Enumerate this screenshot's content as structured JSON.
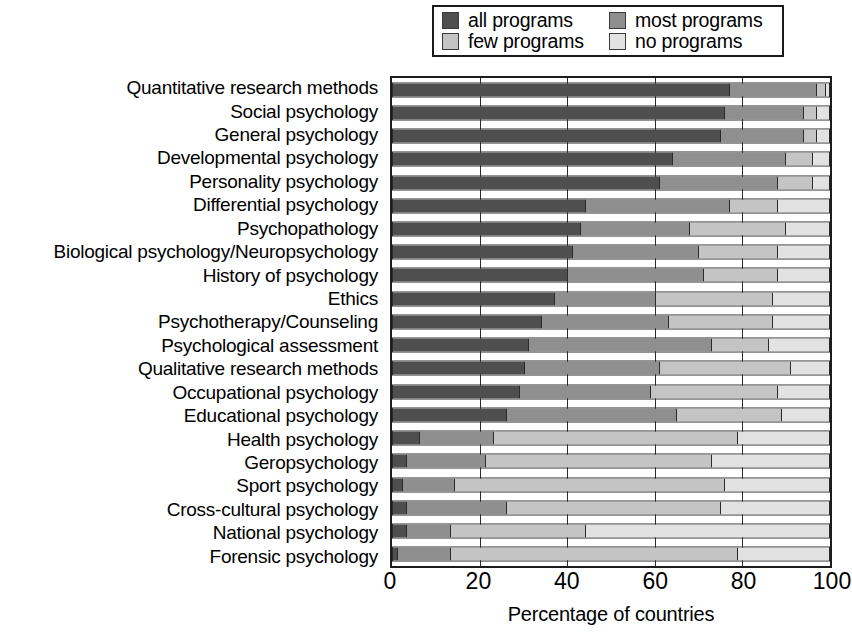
{
  "legend": {
    "entries": [
      {
        "label": "all programs",
        "key": "all",
        "color": "#4f4f4f"
      },
      {
        "label": "most programs",
        "key": "most",
        "color": "#8f8f8f"
      },
      {
        "label": "few programs",
        "key": "few",
        "color": "#c4c4c4"
      },
      {
        "label": "no programs",
        "key": "no",
        "color": "#e2e2e2"
      }
    ]
  },
  "axis": {
    "x_title": "Percentage of countries",
    "x_ticks": [
      0,
      20,
      40,
      60,
      80,
      100
    ],
    "x_min": 0,
    "x_max": 100
  },
  "chart_data": {
    "type": "bar",
    "orientation": "horizontal",
    "stacked": true,
    "stack_total": 100,
    "title": "",
    "subtitle": "",
    "xlabel": "Percentage of countries",
    "ylabel": "",
    "xlim": [
      0,
      100
    ],
    "x_ticks": [
      0,
      20,
      40,
      60,
      80,
      100
    ],
    "grid": true,
    "legend_position": "top",
    "series": [
      {
        "name": "all programs",
        "color": "#4f4f4f",
        "values": [
          77,
          76,
          75,
          64,
          61,
          44,
          43,
          41,
          40,
          37,
          34,
          31,
          30,
          29,
          26,
          6,
          3,
          2,
          3,
          3,
          1
        ]
      },
      {
        "name": "most programs",
        "color": "#8f8f8f",
        "values": [
          20,
          18,
          19,
          26,
          27,
          33,
          25,
          29,
          31,
          23,
          29,
          42,
          31,
          30,
          39,
          17,
          18,
          12,
          23,
          10,
          12
        ]
      },
      {
        "name": "few programs",
        "color": "#c4c4c4",
        "values": [
          2,
          3,
          3,
          6,
          8,
          11,
          22,
          18,
          17,
          27,
          24,
          13,
          30,
          29,
          24,
          56,
          52,
          62,
          49,
          31,
          66
        ]
      },
      {
        "name": "no programs",
        "color": "#e2e2e2",
        "values": [
          1,
          3,
          3,
          4,
          4,
          12,
          10,
          12,
          12,
          13,
          13,
          14,
          9,
          12,
          11,
          21,
          27,
          24,
          25,
          56,
          21
        ]
      }
    ],
    "categories": [
      "Quantitative research methods",
      "Social psychology",
      "General psychology",
      "Developmental psychology",
      "Personality psychology",
      "Differential psychology",
      "Psychopathology",
      "Biological psychology/Neuropsychology",
      "History of psychology",
      "Ethics",
      "Psychotherapy/Counseling",
      "Psychological assessment",
      "Qualitative research methods",
      "Occupational psychology",
      "Educational psychology",
      "Health psychology",
      "Geropsychology",
      "Sport psychology",
      "Cross-cultural psychology",
      "National psychology",
      "Forensic psychology"
    ]
  }
}
